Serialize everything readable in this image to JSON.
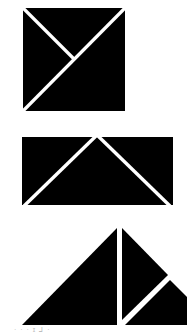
{
  "figure": {
    "fill_color": "#000000",
    "gap_color": "#ffffff",
    "background": "#ffffff",
    "shapes": [
      {
        "name": "square",
        "pieces": 3,
        "description": "Square divided into three triangles by one full diagonal and a half diagonal"
      },
      {
        "name": "rectangle",
        "pieces": 3,
        "description": "Rectangle divided into a central isosceles triangle and two corner triangles"
      },
      {
        "name": "large-triangle",
        "pieces": 3,
        "description": "Right triangle split by a vertical line and a diagonal cut on the right part"
      }
    ]
  },
  "caption": {
    "text": "· · · ɪ ⅃ ·"
  }
}
